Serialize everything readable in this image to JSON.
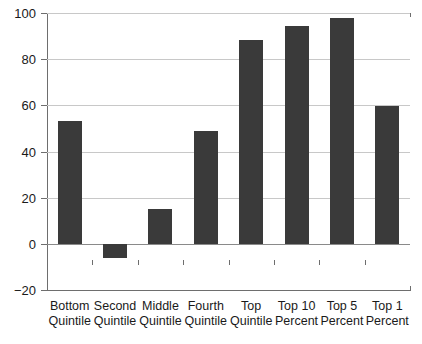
{
  "chart_data": {
    "type": "bar",
    "title": "",
    "subtitle": "",
    "xlabel": "",
    "ylabel": "",
    "categories": [
      "Bottom Quintile",
      "Second Quintile",
      "Middle Quintile",
      "Fourth Quintile",
      "Top Quintile",
      "Top 10 Percent",
      "Top 5 Percent",
      "Top 1 Percent"
    ],
    "category_lines": [
      [
        "Bottom",
        "Quintile"
      ],
      [
        "Second",
        "Quintile"
      ],
      [
        "Middle",
        "Quintile"
      ],
      [
        "Fourth",
        "Quintile"
      ],
      [
        "Top",
        "Quintile"
      ],
      [
        "Top 10",
        "Percent"
      ],
      [
        "Top 5",
        "Percent"
      ],
      [
        "Top 1",
        "Percent"
      ]
    ],
    "values": [
      53,
      -6,
      15,
      49,
      88.5,
      94.5,
      98,
      59.5
    ],
    "ylim": [
      -20,
      100
    ],
    "yticks": [
      -20,
      0,
      20,
      40,
      60,
      80,
      100
    ],
    "ytick_labels": [
      "−20",
      "0",
      "20",
      "40",
      "60",
      "80",
      "100"
    ],
    "grid": true,
    "grid_axis": "y",
    "legend": false,
    "bar_color": "#3a3a3a",
    "grid_color": "#c8c8c8",
    "axis_color": "#6e6e6e",
    "background": "#ffffff"
  }
}
